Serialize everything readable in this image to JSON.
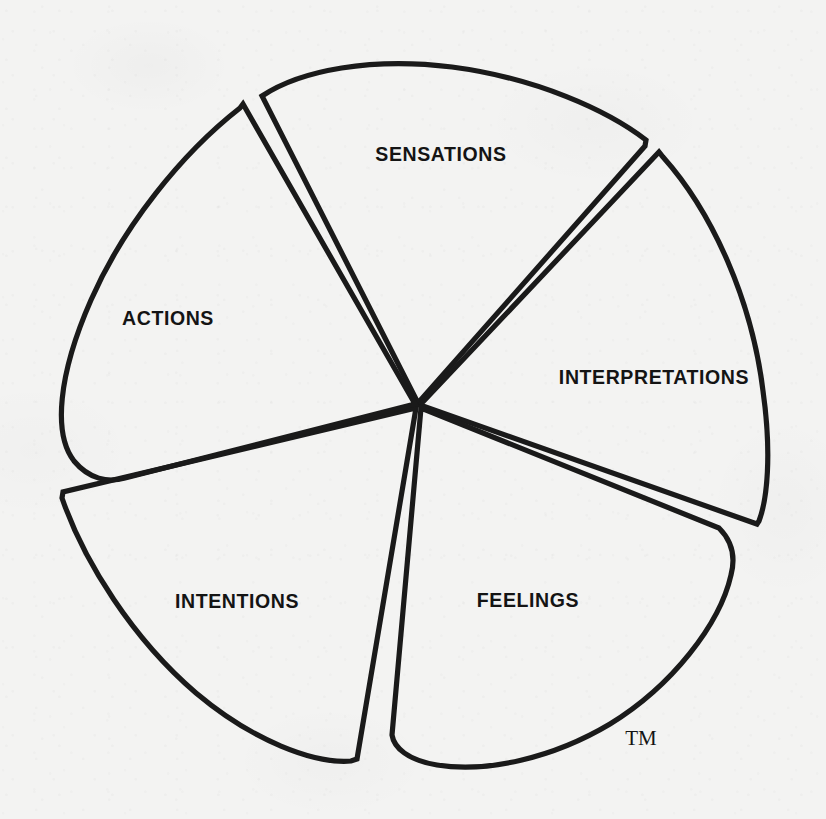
{
  "diagram": {
    "type": "petal-wheel",
    "background_color": "#f3f3f2",
    "stroke_color": "#1a1a1a",
    "center": {
      "x": 418,
      "y": 405
    },
    "trademark": {
      "label": "TM",
      "x": 641,
      "y": 740
    },
    "petals": [
      {
        "id": "sensations",
        "label": "SENSATIONS",
        "label_x": 441,
        "label_y": 156,
        "path": "M 418 403 L 262 96 C 301 70 372 57 452 67 C 536 78 607 110 646 140 L 645 146 L 418 403 Z"
      },
      {
        "id": "interpretations",
        "label": "INTERPRETATIONS",
        "label_x": 654,
        "label_y": 379,
        "path": "M 420 405 L 659 152 L 663 157 C 713 213 752 301 763 391 C 772 455 767 500 759 521 L 757 524 L 420 405 Z"
      },
      {
        "id": "feelings",
        "label": "FEELINGS",
        "label_x": 528,
        "label_y": 602,
        "path": "M 421 408 L 719 528 C 732 541 736 556 731 575 C 720 624 672 686 610 724 C 553 758 487 773 437 765 C 408 760 394 748 392 735 L 421 408 Z"
      },
      {
        "id": "intentions",
        "label": "INTENTIONS",
        "label_x": 237,
        "label_y": 603,
        "path": "M 416 408 L 63 492 L 62 498 C 84 562 133 639 196 693 C 253 741 314 764 351 761 L 357 759 L 416 408 Z"
      },
      {
        "id": "actions",
        "label": "ACTIONS",
        "label_x": 168,
        "label_y": 320,
        "path": "M 415 404 L 243 104 L 240 108 C 181 154 123 227 91 300 C 58 375 53 434 74 461 C 89 479 108 483 125 478 L 415 404 Z"
      }
    ]
  }
}
